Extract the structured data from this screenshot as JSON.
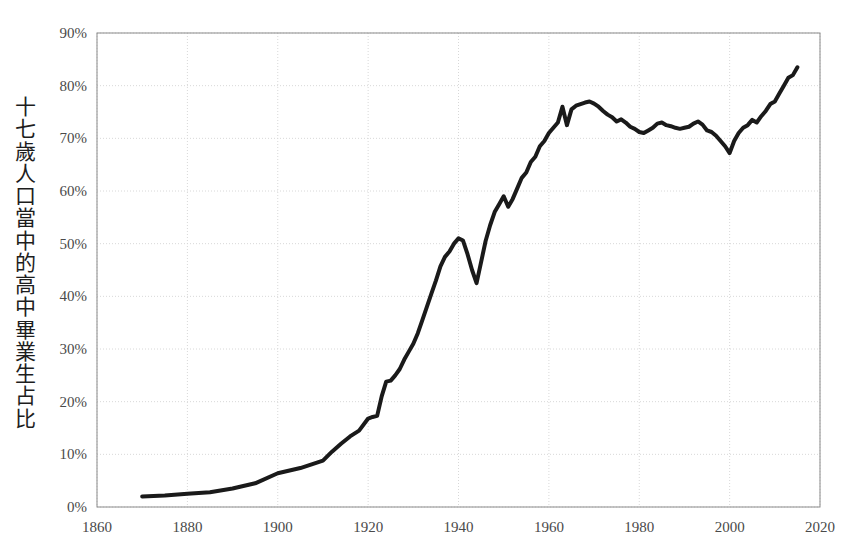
{
  "chart_data": {
    "type": "line",
    "title": "",
    "subtitle": "",
    "xlabel": "",
    "ylabel": "十七歲人口當中的高中畢業生占比",
    "xlim": [
      1860,
      2020
    ],
    "ylim": [
      0,
      90
    ],
    "xticks": [
      1860,
      1880,
      1900,
      1920,
      1940,
      1960,
      1980,
      2000,
      2020
    ],
    "xtick_labels": [
      "1860",
      "1880",
      "1900",
      "1920",
      "1940",
      "1960",
      "1980",
      "2000",
      "2020"
    ],
    "yticks": [
      0,
      10,
      20,
      30,
      40,
      50,
      60,
      70,
      80,
      90
    ],
    "ytick_labels": [
      "0%",
      "10%",
      "20%",
      "30%",
      "40%",
      "50%",
      "60%",
      "70%",
      "80%",
      "90%"
    ],
    "grid": true,
    "grid_style": "dotted",
    "legend": false,
    "legend_position": "none",
    "line_color": "#1a1a1a",
    "line_width": 4,
    "grid_color": "#d8d8d8",
    "axis_color": "#8a8a8a",
    "tick_label_color": "#4a4a4a",
    "background_color": "#ffffff",
    "series": [
      {
        "name": "High school graduates as share of 17-year-olds",
        "x": [
          1870,
          1875,
          1880,
          1885,
          1890,
          1895,
          1900,
          1905,
          1910,
          1912,
          1914,
          1916,
          1918,
          1920,
          1921,
          1922,
          1923,
          1924,
          1925,
          1926,
          1927,
          1928,
          1929,
          1930,
          1931,
          1932,
          1933,
          1934,
          1935,
          1936,
          1937,
          1938,
          1939,
          1940,
          1941,
          1942,
          1943,
          1944,
          1945,
          1946,
          1947,
          1948,
          1949,
          1950,
          1951,
          1952,
          1953,
          1954,
          1955,
          1956,
          1957,
          1958,
          1959,
          1960,
          1961,
          1962,
          1963,
          1964,
          1965,
          1966,
          1967,
          1968,
          1969,
          1970,
          1971,
          1972,
          1973,
          1974,
          1975,
          1976,
          1977,
          1978,
          1979,
          1980,
          1981,
          1982,
          1983,
          1984,
          1985,
          1986,
          1987,
          1988,
          1989,
          1990,
          1991,
          1992,
          1993,
          1994,
          1995,
          1996,
          1997,
          1998,
          1999,
          2000,
          2001,
          2002,
          2003,
          2004,
          2005,
          2006,
          2007,
          2008,
          2009,
          2010,
          2011,
          2012,
          2013,
          2014,
          2015
        ],
        "y": [
          2.0,
          2.2,
          2.5,
          2.8,
          3.5,
          4.5,
          6.4,
          7.4,
          8.8,
          10.5,
          12.0,
          13.4,
          14.5,
          16.8,
          17.1,
          17.3,
          21.0,
          23.8,
          24.0,
          25.0,
          26.2,
          28.0,
          29.5,
          31.0,
          33.0,
          35.5,
          38.0,
          40.5,
          43.0,
          45.7,
          47.5,
          48.5,
          50.0,
          51.0,
          50.6,
          48.0,
          45.0,
          42.5,
          46.5,
          50.5,
          53.5,
          56.0,
          57.5,
          59.0,
          57.0,
          58.5,
          60.5,
          62.5,
          63.5,
          65.5,
          66.5,
          68.5,
          69.5,
          71.0,
          72.0,
          73.0,
          76.0,
          72.5,
          75.5,
          76.2,
          76.5,
          76.8,
          77.0,
          76.6,
          76.0,
          75.2,
          74.5,
          74.0,
          73.2,
          73.6,
          73.0,
          72.2,
          71.8,
          71.2,
          71.0,
          71.5,
          72.0,
          72.8,
          73.0,
          72.5,
          72.3,
          72.0,
          71.8,
          72.0,
          72.2,
          72.8,
          73.2,
          72.6,
          71.5,
          71.2,
          70.5,
          69.5,
          68.5,
          67.2,
          69.5,
          71.0,
          72.0,
          72.5,
          73.5,
          73.0,
          74.2,
          75.2,
          76.5,
          77.0,
          78.5,
          80.0,
          81.5,
          82.0,
          83.5
        ]
      }
    ]
  },
  "axis_label_text": "十七歲人口當中的高中畢業生占比"
}
